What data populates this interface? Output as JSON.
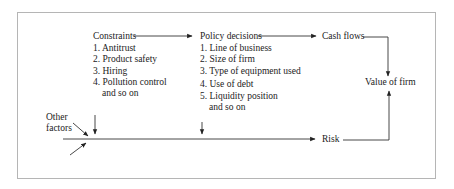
{
  "diagram": {
    "nodes": {
      "constraints": {
        "title": "Constraints",
        "items": [
          "1. Antitrust",
          "2. Product safety",
          "3. Hiring",
          "4. Pollution control",
          "and so on"
        ]
      },
      "policy": {
        "title": "Policy decisions",
        "items": [
          "1. Line of business",
          "2. Size of firm",
          "3. Type of equipment used",
          "4. Use of debt",
          "5. Liquidity position",
          "and so on"
        ]
      },
      "cash_flows": "Cash flows",
      "value_of_firm": "Value of firm",
      "risk": "Risk",
      "other_factors": [
        "Other",
        "factors"
      ]
    },
    "edges": [
      {
        "from": "Constraints",
        "to": "Policy decisions"
      },
      {
        "from": "Policy decisions",
        "to": "Cash flows"
      },
      {
        "from": "Cash flows",
        "to": "Value of firm"
      },
      {
        "from": "Risk",
        "to": "Value of firm"
      },
      {
        "from": "Constraints",
        "to": "Risk"
      },
      {
        "from": "Policy decisions",
        "to": "Risk"
      },
      {
        "from": "Other factors",
        "to": "Risk"
      }
    ]
  }
}
